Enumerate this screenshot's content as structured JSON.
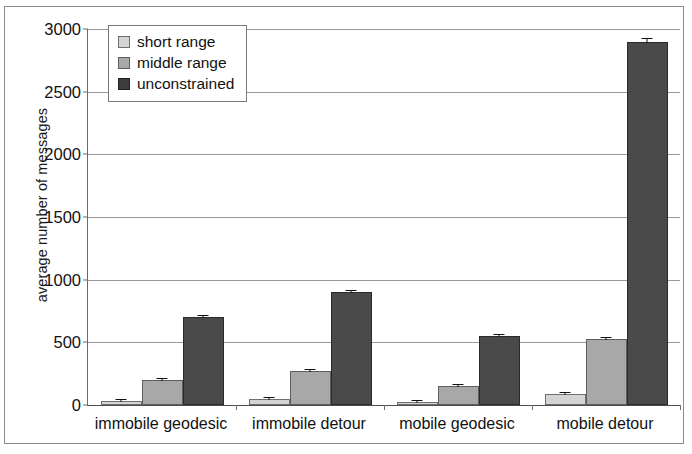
{
  "chart_data": {
    "type": "bar",
    "title": "",
    "xlabel": "",
    "ylabel": "average number of messages",
    "ylim": [
      0,
      3000
    ],
    "ytick_step": 500,
    "yticks": [
      "3000",
      "2500",
      "2000",
      "1500",
      "1000",
      "500",
      "0"
    ],
    "grid": true,
    "legend_position": "upper-left-inside",
    "categories": [
      "immobile geodesic",
      "immobile detour",
      "mobile geodesic",
      "mobile detour"
    ],
    "series": [
      {
        "name": "short range",
        "color": "#d4d4d4",
        "values": [
          30,
          50,
          25,
          85
        ],
        "errors": [
          5,
          6,
          4,
          8
        ]
      },
      {
        "name": "middle range",
        "color": "#a8a8a8",
        "values": [
          200,
          275,
          150,
          525
        ],
        "errors": [
          10,
          10,
          8,
          14
        ]
      },
      {
        "name": "unconstrained",
        "color": "#3d3d3d",
        "values": [
          700,
          905,
          550,
          2900
        ],
        "errors": [
          18,
          16,
          12,
          35
        ]
      }
    ]
  },
  "legend": {
    "items": [
      {
        "label": "short range",
        "swatch": "short"
      },
      {
        "label": "middle range",
        "swatch": "middle"
      },
      {
        "label": "unconstrained",
        "swatch": "uncon"
      }
    ]
  },
  "axes": {
    "y_title": "average number of messages"
  }
}
